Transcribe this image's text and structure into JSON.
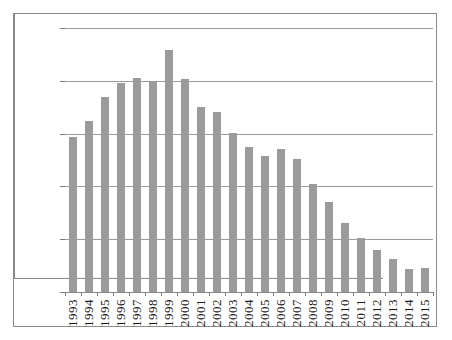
{
  "chart_data": {
    "type": "bar",
    "title": "",
    "subtitle": "",
    "xlabel": "",
    "ylabel": "",
    "ylim": [
      50000,
      75000
    ],
    "ytick_step": 5000,
    "ytick_labels": [
      "75,000",
      "70,000",
      "65,000",
      "60,000",
      "55,000",
      "50,000"
    ],
    "ytick_values": [
      75000,
      70000,
      65000,
      60000,
      55000,
      50000
    ],
    "grid": true,
    "grid_axis": "y",
    "legend": null,
    "bar_color": "#9b9b9b",
    "axis_color": "#8a8a8a",
    "text_color": "#1a1a1a",
    "categories": [
      "1993",
      "1994",
      "1995",
      "1996",
      "1997",
      "1998",
      "1999",
      "2000",
      "2001",
      "2002",
      "2003",
      "2004",
      "2005",
      "2006",
      "2007",
      "2008",
      "2009",
      "2010",
      "2011",
      "2012",
      "2013",
      "2014",
      "2015"
    ],
    "values": [
      64650,
      66200,
      68450,
      69750,
      70300,
      70000,
      72900,
      70200,
      67500,
      67000,
      65100,
      63700,
      62850,
      63500,
      62600,
      60200,
      58500,
      56500,
      55100,
      54000,
      53100,
      52200,
      52300
    ]
  }
}
